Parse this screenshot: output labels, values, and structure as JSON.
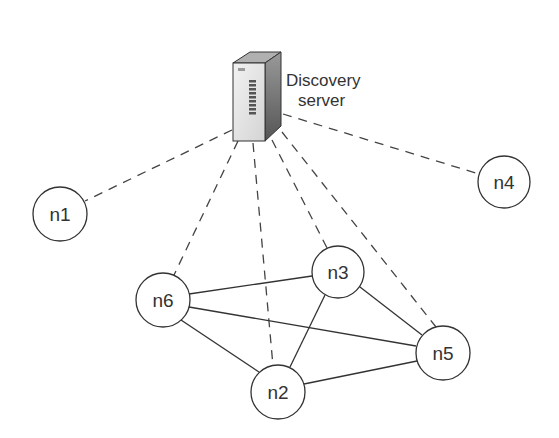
{
  "diagram": {
    "server": {
      "label_line1": "Discovery",
      "label_line2": "server"
    },
    "nodes": [
      {
        "id": "n1",
        "label": "n1",
        "cx": 60,
        "cy": 214,
        "r": 27
      },
      {
        "id": "n2",
        "label": "n2",
        "cx": 278,
        "cy": 392,
        "r": 27
      },
      {
        "id": "n3",
        "label": "n3",
        "cx": 338,
        "cy": 272,
        "r": 26
      },
      {
        "id": "n4",
        "label": "n4",
        "cx": 504,
        "cy": 182,
        "r": 26
      },
      {
        "id": "n5",
        "label": "n5",
        "cx": 443,
        "cy": 353,
        "r": 27
      },
      {
        "id": "n6",
        "label": "n6",
        "cx": 163,
        "cy": 300,
        "r": 27
      }
    ],
    "discovery_links": [
      "n1",
      "n2",
      "n3",
      "n4",
      "n5",
      "n6"
    ],
    "peer_links": [
      [
        "n6",
        "n3"
      ],
      [
        "n6",
        "n5"
      ],
      [
        "n6",
        "n2"
      ],
      [
        "n3",
        "n2"
      ],
      [
        "n3",
        "n5"
      ],
      [
        "n2",
        "n5"
      ]
    ],
    "colors": {
      "stroke": "#333333",
      "dashed": "#444444",
      "server_front": "#e6e6e6",
      "server_side": "#7a7a7a",
      "server_top": "#a8a8a8"
    }
  }
}
